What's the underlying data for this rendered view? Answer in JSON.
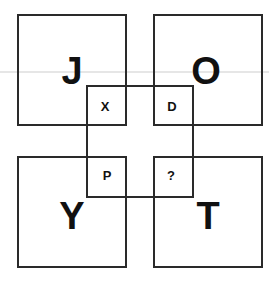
{
  "puzzle": {
    "outer": {
      "top_left": "J",
      "top_right": "O",
      "bottom_left": "Y",
      "bottom_right": "T"
    },
    "inner": {
      "top_left": "X",
      "top_right": "D",
      "bottom_left": "P",
      "bottom_right": "?"
    }
  },
  "colors": {
    "line": "#2a2a2a",
    "text": "#111111",
    "background": "#ffffff"
  }
}
